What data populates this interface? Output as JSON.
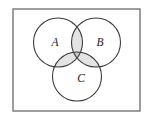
{
  "figure": {
    "background_color": "#ffffff"
  },
  "universe_rect": {
    "name": "universal-set-rectangle",
    "x": 13,
    "y": 9,
    "width": 127,
    "height": 102,
    "stroke_color": "#767676",
    "fill_color": "#ffffff",
    "stroke_width": 1.4
  },
  "circles": [
    {
      "id": "A",
      "label": "A",
      "cx": 58,
      "cy": 42.5,
      "r": 24.5,
      "label_x": 55,
      "label_y": 43,
      "stroke_color": "#3a3a3a",
      "fill_color": "none",
      "stroke_width": 1.1
    },
    {
      "id": "B",
      "label": "B",
      "cx": 96,
      "cy": 42.5,
      "r": 24.5,
      "label_x": 100,
      "label_y": 43,
      "stroke_color": "#3a3a3a",
      "fill_color": "none",
      "stroke_width": 1.1
    },
    {
      "id": "C",
      "label": "C",
      "cx": 77,
      "cy": 76.5,
      "r": 24.5,
      "label_x": 81,
      "label_y": 79,
      "stroke_color": "#3a3a3a",
      "fill_color": "none",
      "stroke_width": 1.1
    }
  ],
  "shaded_regions": [
    {
      "id": "A-and-B",
      "name": "region-a-intersect-b",
      "fill_color": "#e3e3e3",
      "description": "lens between circles A and B, above the center"
    },
    {
      "id": "A-and-C",
      "name": "region-a-intersect-c",
      "fill_color": "#e3e3e3",
      "description": "lens between circles A and C, lower left"
    },
    {
      "id": "B-and-C",
      "name": "region-b-intersect-c",
      "fill_color": "#e3e3e3",
      "description": "lens between circles B and C, lower right"
    },
    {
      "id": "A-and-B-and-C",
      "name": "region-a-intersect-b-intersect-c",
      "fill_color": "#c9c9c9",
      "description": "central curved triangle common to all three circles"
    }
  ],
  "chart_data": {
    "type": "diagram",
    "subtype": "venn",
    "title": "",
    "sets": [
      "A",
      "B",
      "C"
    ],
    "set_labels": [
      "A",
      "B",
      "C"
    ],
    "shaded": [
      "A∩B",
      "A∩C",
      "B∩C",
      "A∩B∩C"
    ],
    "unshaded": [
      "A only",
      "B only",
      "C only",
      "outside all sets"
    ],
    "legend": "none",
    "grid": false
  }
}
